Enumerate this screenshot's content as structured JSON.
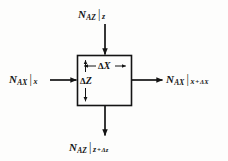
{
  "figure": {
    "background_color": "#fdfdfc",
    "ink_color": "#141414"
  },
  "control_volume": {
    "name": "control-volume-box",
    "x": 77,
    "y": 55,
    "width": 55,
    "height": 51,
    "stroke_color": "#141414"
  },
  "labels": {
    "top": {
      "symbol": "N",
      "subscript": "AZ",
      "bar": "|",
      "evaluated_at": "z",
      "full_text": "N_AZ | z"
    },
    "bottom": {
      "symbol": "N",
      "subscript": "AZ",
      "bar": "|",
      "evaluated_at": "z",
      "plus": "+",
      "increment": "Δz",
      "full_text": "N_AZ | z + Δz"
    },
    "left": {
      "symbol": "N",
      "subscript": "AX",
      "bar": "|",
      "evaluated_at": "x",
      "full_text": "N_AX | x"
    },
    "right": {
      "symbol": "N",
      "subscript": "AX",
      "bar": "|",
      "evaluated_at": "x",
      "plus": "+",
      "increment": "ΔX",
      "full_text": "N_AX | x + ΔX"
    }
  },
  "dimensions": {
    "width_label": {
      "delta": "Δ",
      "axis": "X",
      "full_text": "ΔX"
    },
    "height_label": {
      "delta": "Δ",
      "axis": "Z",
      "full_text": "ΔZ"
    }
  },
  "arrows": {
    "top_inflow": {
      "direction": "down",
      "x": 105,
      "y_start": 24,
      "y_end": 55
    },
    "bottom_outflow": {
      "direction": "down",
      "x": 105,
      "y_start": 106,
      "y_end": 136
    },
    "left_inflow": {
      "direction": "right",
      "y": 80,
      "x_start": 50,
      "x_end": 77
    },
    "right_outflow": {
      "direction": "right",
      "y": 80,
      "x_start": 132,
      "x_end": 163
    }
  }
}
